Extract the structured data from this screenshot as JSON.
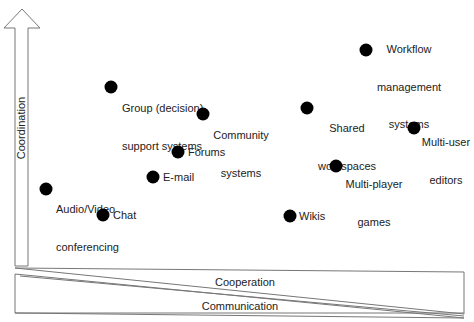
{
  "axes": {
    "vertical": "Coordination",
    "bands": {
      "top": "Cooperation",
      "bottom": "Communication"
    }
  },
  "items": [
    {
      "label_line1": "Workflow",
      "label_line2": "management",
      "label_line3": "systems"
    },
    {
      "label_line1": "Group (decision)",
      "label_line2": "support systems"
    },
    {
      "label_line1": "Community",
      "label_line2": "systems"
    },
    {
      "label_line1": "Shared",
      "label_line2": "workspaces"
    },
    {
      "label_line1": "Multi-user",
      "label_line2": "editors"
    },
    {
      "label_line1": "Forums"
    },
    {
      "label_line1": "E-mail"
    },
    {
      "label_line1": "Multi-player",
      "label_line2": "games"
    },
    {
      "label_line1": "Audio/Video",
      "label_line2": "conferencing"
    },
    {
      "label_line1": "Chat"
    },
    {
      "label_line1": "Wikis"
    }
  ]
}
